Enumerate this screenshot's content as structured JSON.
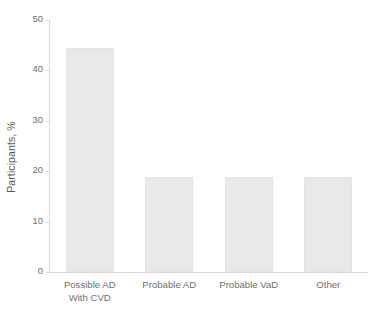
{
  "chart_data": {
    "type": "bar",
    "title": "",
    "xlabel": "",
    "ylabel": "Participants, %",
    "categories": [
      "Possible AD\nWith CVD",
      "Probable AD",
      "Probable VaD",
      "Other"
    ],
    "values": [
      44.5,
      18.8,
      18.8,
      18.8
    ],
    "ylim": [
      0,
      50
    ],
    "yticks": [
      0,
      10,
      20,
      30,
      40,
      50
    ],
    "ytick_labels": [
      "0",
      "10",
      "20",
      "30",
      "40",
      "50"
    ],
    "grid": false,
    "legend": null,
    "bar_color": "#e9e9e9",
    "axis_color": "#d8d8d8",
    "text_color": "#6f6f6f",
    "background": "#ffffff"
  }
}
